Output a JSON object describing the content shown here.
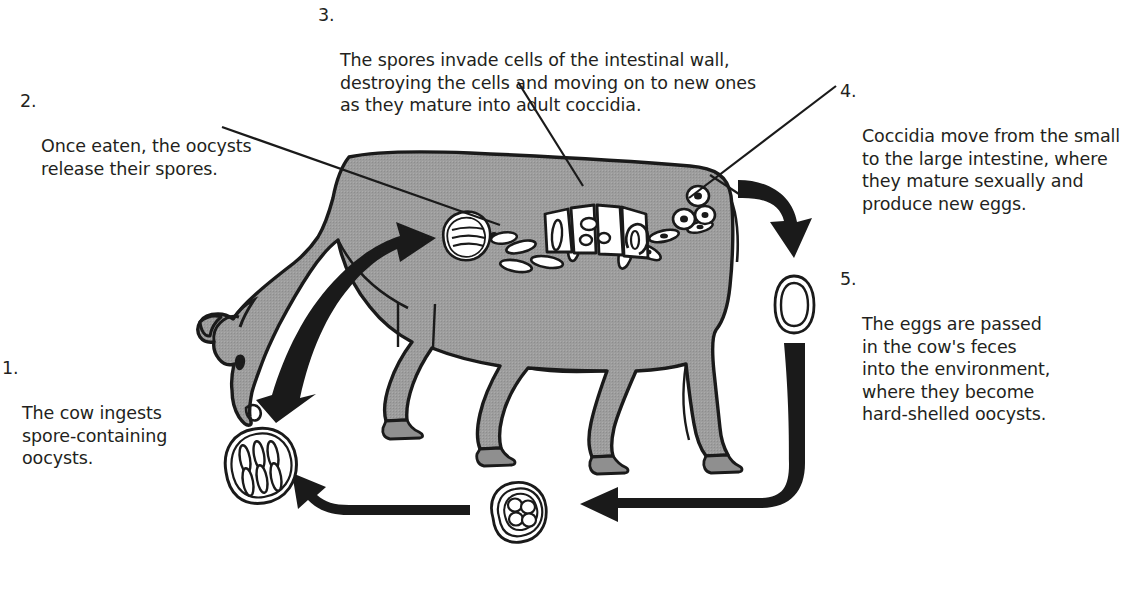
{
  "diagram": {
    "subject": "cow",
    "colors": {
      "animal_fill": "#9a9a9a",
      "outline": "#1a1a1a",
      "text": "#231f20",
      "arrow": "#1a1a1a",
      "background": "#ffffff",
      "organism_fill": "#ffffff"
    },
    "steps": [
      {
        "id": 1,
        "number": "1.",
        "text": "The cow ingests\nspore-containing\noocysts.",
        "has_leader_line": false
      },
      {
        "id": 2,
        "number": "2.",
        "text": "Once eaten, the oocysts\nrelease their spores.",
        "has_leader_line": true
      },
      {
        "id": 3,
        "number": "3.",
        "text": "The spores invade cells of the intestinal wall,\ndestroying the cells and moving on to new ones\nas they mature into adult coccidia.",
        "has_leader_line": true
      },
      {
        "id": 4,
        "number": "4.",
        "text": "Coccidia move from the small\nto the large intestine, where\nthey mature sexually and\nproduce new eggs.",
        "has_leader_line": true
      },
      {
        "id": 5,
        "number": "5.",
        "text": "The eggs are passed\nin the cow's feces\ninto the environment,\nwhere they become\nhard-shelled oocysts.",
        "has_leader_line": false
      }
    ],
    "figures": [
      {
        "name": "cow-body",
        "description": "grazing cow, grey fill, black outline"
      },
      {
        "name": "ingestion-arrow",
        "description": "thick black arrow from mouth into gut"
      },
      {
        "name": "oocyst-releasing-spores",
        "description": "opened oocyst with sporozoites emerging"
      },
      {
        "name": "free-spores",
        "description": "elongated sporozoites in the gut"
      },
      {
        "name": "intestinal-wall-cells",
        "description": "white wedge-shaped epithelial cells being invaded"
      },
      {
        "name": "adult-coccidia-eggs",
        "description": "ring-shaped eggs near the large intestine"
      },
      {
        "name": "excreted-oocyst",
        "description": "double-walled unsporulated oocyst outside the cow"
      },
      {
        "name": "sporulating-oocyst",
        "description": "oocyst with four internal sporoblasts"
      },
      {
        "name": "sporulated-oocyst",
        "description": "infective oocyst packed with sporozoites"
      },
      {
        "name": "cycle-arrow-down-right",
        "description": "arrow from rear of cow downward"
      },
      {
        "name": "cycle-arrow-bottom-right",
        "description": "arrow curving down and left along the ground"
      },
      {
        "name": "cycle-arrow-bottom-left",
        "description": "arrow pointing left toward the sporulated oocyst"
      }
    ]
  }
}
